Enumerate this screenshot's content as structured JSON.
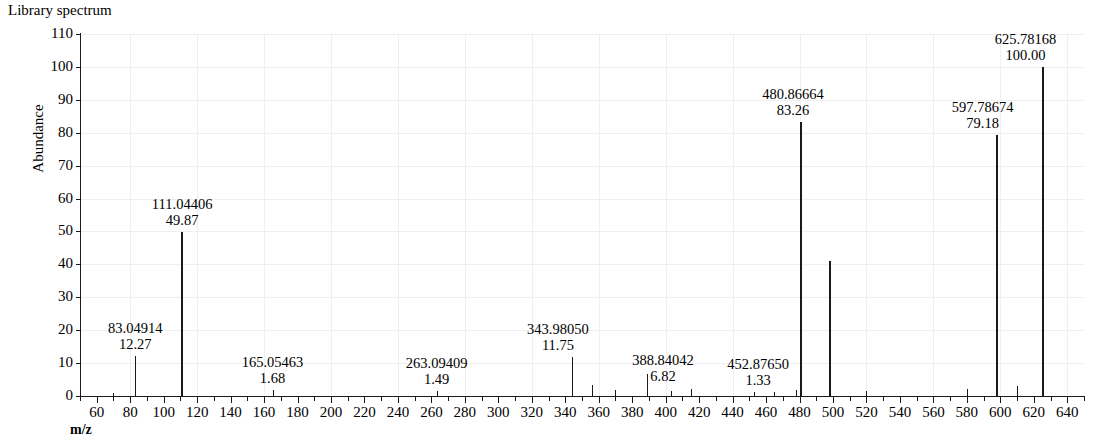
{
  "chart_title": "Library spectrum",
  "axes": {
    "y_title": "Abundance",
    "x_title": "m/z",
    "y_ticks": [
      0,
      10,
      20,
      30,
      40,
      50,
      60,
      70,
      80,
      90,
      100,
      110
    ],
    "x_ticks": [
      60,
      80,
      100,
      120,
      140,
      160,
      180,
      200,
      220,
      240,
      260,
      280,
      300,
      320,
      340,
      360,
      380,
      400,
      420,
      440,
      460,
      480,
      500,
      520,
      540,
      560,
      580,
      600,
      620,
      640
    ],
    "x_minor_step": 10
  },
  "chart_data": {
    "type": "bar",
    "title": "Library spectrum",
    "subtitle": "",
    "xlabel": "m/z",
    "ylabel": "Abundance",
    "xlim": [
      50,
      650
    ],
    "ylim": [
      0,
      110
    ],
    "grid": true,
    "legend": "none",
    "annotation_format": "m/z value above relative abundance",
    "x": [
      70.0,
      83.04914,
      111.04406,
      165.05463,
      263.09409,
      343.9805,
      356.0,
      370.0,
      388.84042,
      403.0,
      415.0,
      452.8765,
      465.0,
      478.0,
      480.86664,
      498.5,
      520.0,
      580.0,
      597.78674,
      610.0,
      625.78168
    ],
    "values": [
      1.0,
      12.27,
      49.87,
      1.68,
      1.49,
      11.75,
      3.2,
      1.8,
      6.82,
      1.5,
      2.2,
      1.33,
      1.1,
      1.8,
      83.26,
      41.0,
      1.6,
      2.0,
      79.18,
      3.0,
      100.0
    ],
    "labeled_peaks": [
      {
        "mz": "83.04914",
        "abundance": "12.27",
        "mz_value": 83.04914,
        "abundance_value": 12.27
      },
      {
        "mz": "111.04406",
        "abundance": "49.87",
        "mz_value": 111.04406,
        "abundance_value": 49.87
      },
      {
        "mz": "165.05463",
        "abundance": "1.68",
        "mz_value": 165.05463,
        "abundance_value": 1.68
      },
      {
        "mz": "263.09409",
        "abundance": "1.49",
        "mz_value": 263.09409,
        "abundance_value": 1.49
      },
      {
        "mz": "343.98050",
        "abundance": "11.75",
        "mz_value": 343.9805,
        "abundance_value": 11.75
      },
      {
        "mz": "388.84042",
        "abundance": "6.82",
        "mz_value": 388.84042,
        "abundance_value": 6.82
      },
      {
        "mz": "452.87650",
        "abundance": "1.33",
        "mz_value": 452.8765,
        "abundance_value": 1.33
      },
      {
        "mz": "480.86664",
        "abundance": "83.26",
        "mz_value": 480.86664,
        "abundance_value": 83.26
      },
      {
        "mz": "597.78674",
        "abundance": "79.18",
        "mz_value": 597.78674,
        "abundance_value": 79.18
      },
      {
        "mz": "625.78168",
        "abundance": "100.00",
        "mz_value": 625.78168,
        "abundance_value": 100.0
      }
    ],
    "label_offsets": {
      "83.04914": {
        "dx": 0,
        "dy": 0
      },
      "111.04406": {
        "dx": 0,
        "dy": 0
      },
      "165.05463": {
        "dx": 0,
        "dy": 0
      },
      "263.09409": {
        "dx": 0,
        "dy": 0
      },
      "343.98050": {
        "dx": -14,
        "dy": 0
      },
      "388.84042": {
        "dx": 16,
        "dy": 14
      },
      "452.87650": {
        "dx": 4,
        "dy": 0
      },
      "480.86664": {
        "dx": -8,
        "dy": 0
      },
      "597.78674": {
        "dx": -14,
        "dy": 0
      },
      "625.78168": {
        "dx": -18,
        "dy": 0
      }
    }
  },
  "colors": {
    "ink": "#1a1a1a",
    "grid": "#efefef",
    "background": "#ffffff"
  }
}
